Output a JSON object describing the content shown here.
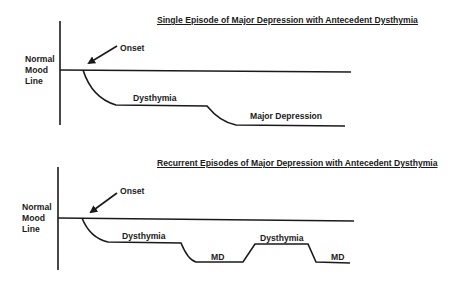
{
  "colors": {
    "ink": "#1a1a1a",
    "background": "#ffffff"
  },
  "top_diagram": {
    "title": "Single Episode of Major Depression with Antecedent Dysthymia",
    "axis_label": "Normal\nMood\nLine",
    "onset_label": "Onset",
    "phases": [
      {
        "label": "Dysthymia"
      },
      {
        "label": "Major Depression"
      }
    ]
  },
  "bottom_diagram": {
    "title": "Recurrent Episodes of Major Depression with Antecedent Dysthymia",
    "axis_label": "Normal\nMood\nLine",
    "onset_label": "Onset",
    "phases": [
      {
        "label": "Dysthymia"
      },
      {
        "label": "MD"
      },
      {
        "label": "Dysthymia"
      },
      {
        "label": "MD"
      }
    ]
  }
}
